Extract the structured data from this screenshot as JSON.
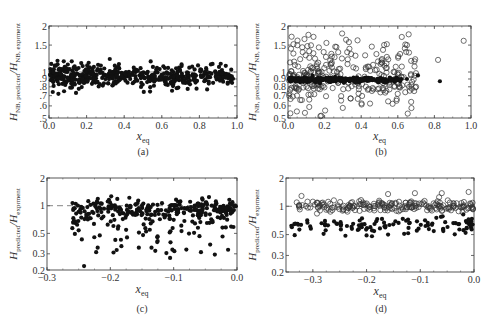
{
  "chart_data": [
    {
      "id": "a",
      "type": "scatter",
      "caption": "(a)",
      "xlabel": "x",
      "xlabel_sub": "eq",
      "ylabel": "H",
      "ylabel_sub1": "NB, predicted",
      "ylabel_mid": "/H",
      "ylabel_sub2": "NB, exprment",
      "xlim": [
        0.0,
        1.0
      ],
      "ylim": [
        0.5,
        2
      ],
      "yscale": "log",
      "xticks": [
        "0.0",
        "0.2",
        "0.4",
        "0.6",
        "0.8",
        "1.0"
      ],
      "yticks": [
        {
          "v": 2,
          "l": "2"
        },
        {
          "v": 1.5,
          "l": "1.5"
        },
        {
          "v": 1,
          "l": "1"
        },
        {
          "v": 0.9,
          "l": ".9"
        },
        {
          "v": 0.8,
          "l": ".8"
        },
        {
          "v": 0.7,
          "l": ".7"
        },
        {
          "v": 0.6,
          "l": ".6"
        },
        {
          "v": 0.5,
          "l": ".5"
        }
      ],
      "reference_line": 1,
      "series": [
        {
          "name": "filled",
          "marker": "filled",
          "count": 520,
          "x_range": [
            0.0,
            0.98
          ],
          "y_center": 0.94,
          "y_spread": 0.08,
          "sample_points": [
            [
              0.87,
              1.13
            ],
            [
              0.92,
              1.03
            ],
            [
              0.97,
              0.91
            ],
            [
              0.85,
              0.84
            ],
            [
              0.75,
              0.83
            ],
            [
              0.62,
              0.83
            ],
            [
              0.02,
              0.74
            ],
            [
              0.05,
              0.72
            ],
            [
              0.1,
              1.12
            ],
            [
              0.35,
              1.1
            ]
          ]
        }
      ]
    },
    {
      "id": "b",
      "type": "scatter",
      "caption": "(b)",
      "xlabel": "x",
      "xlabel_sub": "eq",
      "ylabel": "H",
      "ylabel_sub1": "NB, predicted",
      "ylabel_mid": "/H",
      "ylabel_sub2": "NB, exprment",
      "xlim": [
        0.0,
        1.0
      ],
      "ylim": [
        0.5,
        2
      ],
      "yscale": "log",
      "xticks": [
        "0.0",
        "0.2",
        "0.4",
        "0.6",
        "0.8",
        "1.0"
      ],
      "yticks": [
        {
          "v": 2,
          "l": "2"
        },
        {
          "v": 1.5,
          "l": "1.5"
        },
        {
          "v": 1,
          "l": "1"
        },
        {
          "v": 0.9,
          "l": "0.9"
        },
        {
          "v": 0.8,
          "l": "0.8"
        },
        {
          "v": 0.7,
          "l": "0.7"
        },
        {
          "v": 0.6,
          "l": "0.6"
        },
        {
          "v": 0.5,
          "l": "0.5"
        }
      ],
      "reference_line": null,
      "series": [
        {
          "name": "open",
          "marker": "open",
          "count": 300,
          "x_range": [
            0.0,
            0.7
          ],
          "y_center": 0.97,
          "y_spread": 0.25,
          "sample_points": [
            [
              0.96,
              1.6
            ],
            [
              0.82,
              1.2
            ],
            [
              0.7,
              0.8
            ],
            [
              0.65,
              1.5
            ],
            [
              0.54,
              1.52
            ],
            [
              0.29,
              0.65
            ],
            [
              0.03,
              1.52
            ],
            [
              0.21,
              1.55
            ]
          ]
        },
        {
          "name": "filled",
          "marker": "filled",
          "count": 260,
          "x_range": [
            0.0,
            0.62
          ],
          "y_center": 0.89,
          "y_spread": 0.02,
          "sample_points": [
            [
              0.71,
              0.95
            ],
            [
              0.83,
              0.87
            ],
            [
              0.65,
              0.9
            ]
          ]
        }
      ]
    },
    {
      "id": "c",
      "type": "scatter",
      "caption": "(c)",
      "xlabel": "x",
      "xlabel_sub": "eq",
      "ylabel": "H",
      "ylabel_sub1": "predicted",
      "ylabel_mid": "/H",
      "ylabel_sub2": "exprment",
      "xlim": [
        -0.3,
        0.0
      ],
      "ylim": [
        0.2,
        2
      ],
      "yscale": "log",
      "xticks": [
        "−0.3",
        "−0.2",
        "−0.1",
        "0.0"
      ],
      "yticks": [
        {
          "v": 2,
          "l": "2"
        },
        {
          "v": 1,
          "l": "1"
        },
        {
          "v": 0.5,
          "l": "0.5"
        },
        {
          "v": 0.3,
          "l": "0.3"
        },
        {
          "v": 0.2,
          "l": "0.2"
        }
      ],
      "reference_line": 1,
      "series": [
        {
          "name": "filled",
          "marker": "filled",
          "count": 330,
          "x_range": [
            -0.26,
            0.0
          ],
          "y_center": 0.9,
          "y_spread": 0.12,
          "sample_points": [
            [
              -0.26,
              0.57
            ],
            [
              -0.25,
              0.54
            ],
            [
              -0.245,
              0.43
            ],
            [
              -0.22,
              0.35
            ],
            [
              -0.195,
              0.31
            ],
            [
              -0.19,
              0.33
            ],
            [
              -0.155,
              0.35
            ],
            [
              -0.135,
              0.35
            ],
            [
              -0.105,
              0.4
            ],
            [
              -0.17,
              1.22
            ],
            [
              -0.055,
              1.2
            ]
          ]
        }
      ]
    },
    {
      "id": "d",
      "type": "scatter",
      "caption": "(d)",
      "xlabel": "x",
      "xlabel_sub": "eq",
      "ylabel": "H",
      "ylabel_sub1": "predicted",
      "ylabel_mid": "/H",
      "ylabel_sub2": "exprment",
      "xlim": [
        -0.35,
        0.0
      ],
      "ylim": [
        0.2,
        2
      ],
      "yscale": "log",
      "xticks": [
        "−0.3",
        "−0.2",
        "−0.1",
        "0.0"
      ],
      "yticks": [
        {
          "v": 2,
          "l": "2"
        },
        {
          "v": 1,
          "l": "1"
        },
        {
          "v": 0.5,
          "l": "0.5"
        },
        {
          "v": 0.3,
          "l": "0.3"
        },
        {
          "v": 0.2,
          "l": "0.2"
        }
      ],
      "reference_line": 1,
      "series": [
        {
          "name": "open",
          "marker": "open",
          "count": 210,
          "x_range": [
            -0.33,
            0.0
          ],
          "y_center": 1.0,
          "y_spread": 0.07,
          "sample_points": [
            [
              -0.33,
              1.1
            ],
            [
              -0.31,
              1.12
            ],
            [
              -0.3,
              1.12
            ],
            [
              -0.16,
              1.35
            ],
            [
              -0.11,
              1.38
            ],
            [
              -0.06,
              1.38
            ],
            [
              -0.01,
              1.42
            ]
          ]
        },
        {
          "name": "filled",
          "marker": "filled",
          "count": 110,
          "x_range": [
            -0.34,
            0.0
          ],
          "y_center": 0.62,
          "y_spread": 0.1,
          "sample_points": [
            [
              -0.34,
              0.62
            ],
            [
              -0.28,
              0.51
            ],
            [
              -0.2,
              0.49
            ],
            [
              -0.19,
              0.48
            ],
            [
              -0.16,
              0.5
            ],
            [
              -0.13,
              0.51
            ],
            [
              -0.02,
              0.82
            ],
            [
              0.0,
              0.9
            ]
          ]
        }
      ]
    }
  ]
}
